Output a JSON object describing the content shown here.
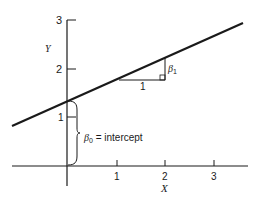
{
  "diagram": {
    "type": "simple-linear-regression-illustration",
    "axes": {
      "x_label": "X",
      "y_label": "Y",
      "x_ticks": [
        "1",
        "2",
        "3"
      ],
      "y_ticks": [
        "1",
        "2",
        "3"
      ]
    },
    "line": {
      "intercept_value": 1.33,
      "slope_value": 0.45
    },
    "annotations": {
      "slope_run_label": "1",
      "slope_rise_label": "β",
      "slope_rise_sub": "1",
      "intercept_label": "β",
      "intercept_sub": "0",
      "intercept_text": " = intercept"
    },
    "colors": {
      "ink": "#1a1a1a",
      "background": "#ffffff"
    }
  }
}
